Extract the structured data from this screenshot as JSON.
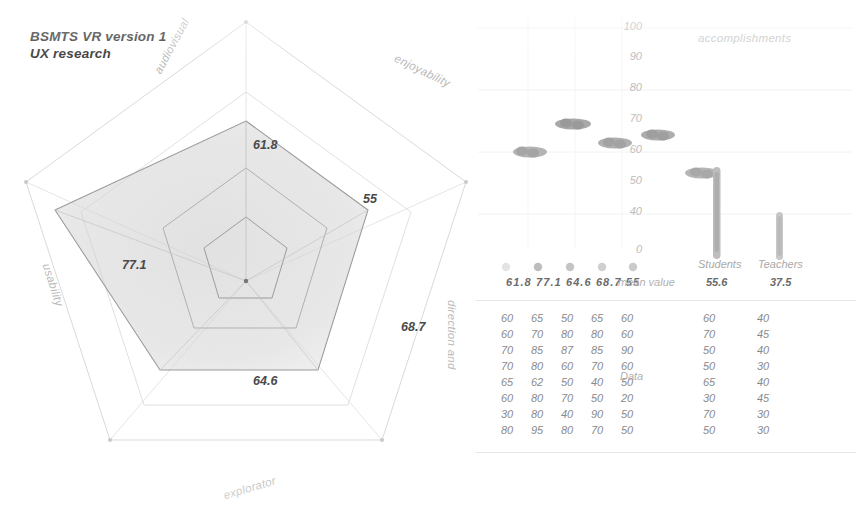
{
  "title": {
    "line1": "BSMTS VR version 1",
    "line2": "UX research"
  },
  "radar": {
    "axis_labels": [
      "audiovisual",
      "enjoyability",
      "direction and",
      "explorator",
      "usability"
    ],
    "values": [
      "61.8",
      "55",
      "68.7",
      "64.6",
      "77.1"
    ]
  },
  "dotplot": {
    "series_label": "accomplishments",
    "y_ticks": [
      "100",
      "90",
      "80",
      "70",
      "60",
      "50",
      "40",
      "0"
    ],
    "columns": [
      "Students",
      "Teachers"
    ],
    "mean_label": "mean value",
    "mean_radar": "61.8 77.1 64.6 68.7 55",
    "mean_students": "55.6",
    "mean_teachers": "37.5"
  },
  "table": {
    "label": "Data",
    "rows": [
      [
        "60",
        "65",
        "50",
        "65",
        "60"
      ],
      [
        "60",
        "70",
        "80",
        "80",
        "60"
      ],
      [
        "70",
        "85",
        "87",
        "85",
        "90"
      ],
      [
        "70",
        "80",
        "60",
        "70",
        "60"
      ],
      [
        "65",
        "62",
        "50",
        "40",
        "50"
      ],
      [
        "60",
        "80",
        "70",
        "50",
        "20"
      ],
      [
        "30",
        "80",
        "40",
        "90",
        "50"
      ],
      [
        "80",
        "95",
        "80",
        "70",
        "50"
      ]
    ],
    "students": [
      "60",
      "70",
      "50",
      "50",
      "65",
      "30",
      "70",
      "50"
    ],
    "teachers": [
      "40",
      "45",
      "40",
      "30",
      "40",
      "45",
      "30",
      "30"
    ]
  },
  "chart_data": [
    {
      "type": "radar",
      "title": "BSMTS VR version 1 UX research",
      "categories": [
        "audiovisual",
        "enjoyability",
        "direction and",
        "explorator",
        "usability"
      ],
      "values": [
        61.8,
        55,
        68.7,
        64.6,
        77.1
      ],
      "ylim": [
        0,
        100
      ],
      "grid": true,
      "rings": 4,
      "legend": "none"
    },
    {
      "type": "scatter",
      "title": "accomplishments",
      "ylabel": "",
      "xlabel": "",
      "ylim": [
        0,
        100
      ],
      "yticks": [
        100,
        90,
        80,
        70,
        60,
        50,
        40,
        0
      ],
      "grid": true,
      "categories": [
        "audiovisual",
        "enjoyability",
        "direction and",
        "explorator",
        "usability",
        "Students",
        "Teachers"
      ],
      "means": [
        61.8,
        77.1,
        64.6,
        68.7,
        55,
        55.6,
        37.5
      ],
      "series": [
        {
          "name": "audiovisual",
          "values": [
            60,
            60,
            70,
            70,
            65,
            60,
            30,
            80
          ]
        },
        {
          "name": "enjoyability",
          "values": [
            65,
            70,
            85,
            80,
            62,
            80,
            80,
            95
          ]
        },
        {
          "name": "direction and",
          "values": [
            50,
            80,
            87,
            60,
            50,
            70,
            40,
            80
          ]
        },
        {
          "name": "explorator",
          "values": [
            65,
            80,
            85,
            70,
            40,
            50,
            90,
            70
          ]
        },
        {
          "name": "usability",
          "values": [
            60,
            60,
            90,
            60,
            50,
            20,
            50,
            50
          ]
        },
        {
          "name": "Students",
          "values": [
            60,
            70,
            50,
            50,
            65,
            30,
            70,
            50
          ]
        },
        {
          "name": "Teachers",
          "values": [
            40,
            45,
            40,
            30,
            40,
            45,
            30,
            30
          ]
        }
      ]
    }
  ]
}
